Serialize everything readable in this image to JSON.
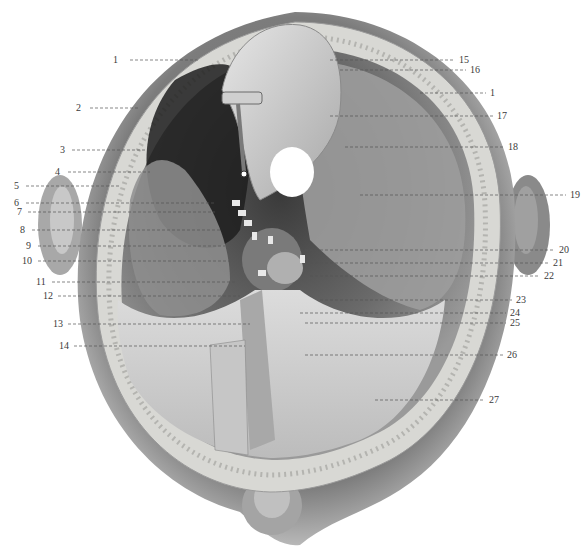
{
  "figure": {
    "colors": {
      "background": "#ffffff",
      "skin": "#8a8a8a",
      "bone": "#d8d8d4",
      "dura": "#bdbdbd",
      "cavity_dark": "#2a2a2a",
      "leader": "#555555",
      "label_text": "#3a3a3a"
    }
  },
  "labels": {
    "left": [
      {
        "num": "1",
        "x": 118,
        "y": 60,
        "lx2": 200
      },
      {
        "num": "2",
        "x": 76,
        "y": 108,
        "lx2": 140
      },
      {
        "num": "3",
        "x": 60,
        "y": 150,
        "lx2": 145
      },
      {
        "num": "4",
        "x": 55,
        "y": 172,
        "lx2": 150
      },
      {
        "num": "5",
        "x": 14,
        "y": 186,
        "lx2": 120
      },
      {
        "num": "6",
        "x": 14,
        "y": 203,
        "lx2": 215
      },
      {
        "num": "7",
        "x": 17,
        "y": 212,
        "lx2": 215
      },
      {
        "num": "8",
        "x": 20,
        "y": 230,
        "lx2": 220
      },
      {
        "num": "9",
        "x": 26,
        "y": 246,
        "lx2": 225
      },
      {
        "num": "10",
        "x": 22,
        "y": 261,
        "lx2": 230
      },
      {
        "num": "11",
        "x": 36,
        "y": 282,
        "lx2": 235
      },
      {
        "num": "12",
        "x": 43,
        "y": 296,
        "lx2": 240
      },
      {
        "num": "13",
        "x": 53,
        "y": 324,
        "lx2": 250
      },
      {
        "num": "14",
        "x": 59,
        "y": 346,
        "lx2": 245
      }
    ],
    "right": [
      {
        "num": "15",
        "x": 459,
        "y": 60,
        "lx1": 330
      },
      {
        "num": "16",
        "x": 470,
        "y": 70,
        "lx1": 340
      },
      {
        "num": "1",
        "x": 490,
        "y": 93,
        "lx1": 420
      },
      {
        "num": "17",
        "x": 497,
        "y": 116,
        "lx1": 330
      },
      {
        "num": "18",
        "x": 508,
        "y": 147,
        "lx1": 345
      },
      {
        "num": "19",
        "x": 570,
        "y": 195,
        "lx1": 360
      },
      {
        "num": "20",
        "x": 559,
        "y": 250,
        "lx1": 300
      },
      {
        "num": "21",
        "x": 553,
        "y": 263,
        "lx1": 305
      },
      {
        "num": "22",
        "x": 544,
        "y": 276,
        "lx1": 310
      },
      {
        "num": "23",
        "x": 516,
        "y": 300,
        "lx1": 320
      },
      {
        "num": "24",
        "x": 510,
        "y": 313,
        "lx1": 300
      },
      {
        "num": "25",
        "x": 510,
        "y": 323,
        "lx1": 305
      },
      {
        "num": "26",
        "x": 507,
        "y": 355,
        "lx1": 305
      },
      {
        "num": "27",
        "x": 489,
        "y": 400,
        "lx1": 375
      }
    ]
  }
}
